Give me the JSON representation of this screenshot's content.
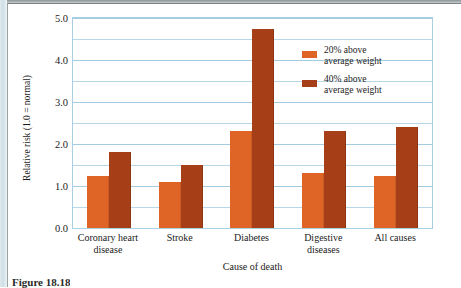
{
  "figure": {
    "caption": "Figure 18.18"
  },
  "chart_data": {
    "type": "bar",
    "title": "",
    "xlabel": "Cause of death",
    "ylabel": "Relative risk (1.0 = normal)",
    "ylim": [
      0.0,
      5.0
    ],
    "ytick_labels": [
      "0.0",
      "1.0",
      "2.0",
      "3.0",
      "4.0",
      "5.0"
    ],
    "ytick_values": [
      0.0,
      1.0,
      2.0,
      3.0,
      4.0,
      5.0
    ],
    "minor_gridline_values": [
      0.5,
      1.5,
      2.5,
      3.5,
      4.5
    ],
    "grid": true,
    "legend_position": "upper-right",
    "categories": [
      "Coronary heart\ndisease",
      "Stroke",
      "Diabetes",
      "Digestive\ndiseases",
      "All causes"
    ],
    "series": [
      {
        "name": "20% above\naverage weight",
        "color": "#df6527",
        "values": [
          1.25,
          1.1,
          2.3,
          1.3,
          1.25
        ]
      },
      {
        "name": "40% above\naverage weight",
        "color": "#a63f18",
        "values": [
          1.8,
          1.5,
          4.75,
          2.3,
          2.4
        ]
      }
    ]
  },
  "colors": {
    "series_20": "#df6527",
    "series_40": "#a63f18",
    "gridline": "#b8d8ea",
    "axis": "#a8cfe4",
    "text": "#1b1b1b"
  }
}
